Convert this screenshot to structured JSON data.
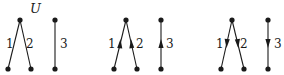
{
  "figure": {
    "top_label": "U",
    "edge_labels": [
      "1",
      "2",
      "3"
    ],
    "colors": {
      "ink": "#1a1a1a",
      "background": "#ffffff"
    },
    "panels": [
      {
        "name": "undirected",
        "labels": {
          "e1": "1",
          "e2": "2",
          "e3": "3"
        },
        "orientation": "none"
      },
      {
        "name": "upward",
        "labels": {
          "e1": "1",
          "e2": "2",
          "e3": "3"
        },
        "orientation": "up"
      },
      {
        "name": "downward",
        "labels": {
          "e1": "1",
          "e2": "2",
          "e3": "3"
        },
        "orientation": "down"
      }
    ]
  }
}
